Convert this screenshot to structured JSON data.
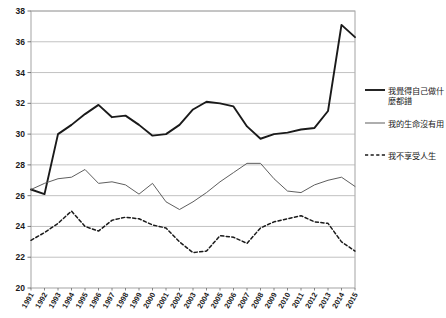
{
  "chart_data": {
    "type": "line",
    "title": "",
    "xlabel": "",
    "ylabel": "",
    "ylim": [
      20,
      38
    ],
    "ytick_step": 2,
    "grid": true,
    "legend_position": "right",
    "categories": [
      "1991",
      "1992",
      "1993",
      "1994",
      "1995",
      "1996",
      "1997",
      "1998",
      "1999",
      "2000",
      "2001",
      "2002",
      "2003",
      "2004",
      "2005",
      "2006",
      "2007",
      "2008",
      "2009",
      "2010",
      "2011",
      "2012",
      "2013",
      "2014",
      "2015"
    ],
    "yticks": [
      "20",
      "22",
      "24",
      "26",
      "28",
      "30",
      "32",
      "34",
      "36",
      "38"
    ],
    "series": [
      {
        "name": "我覺得自己做什麼都錯",
        "style": "solid-thick",
        "color": "#1a1a1a",
        "values": [
          26.4,
          26.1,
          30.0,
          30.6,
          31.3,
          31.9,
          31.1,
          31.2,
          30.6,
          29.9,
          30.0,
          30.6,
          31.6,
          32.1,
          32.0,
          31.8,
          30.5,
          29.7,
          30.0,
          30.1,
          30.3,
          30.4,
          31.5,
          37.1,
          36.3
        ]
      },
      {
        "name": "我的生命沒有用",
        "style": "solid-thin",
        "color": "#555555",
        "values": [
          26.4,
          26.8,
          27.1,
          27.2,
          27.7,
          26.8,
          26.9,
          26.7,
          26.1,
          26.8,
          25.6,
          25.1,
          25.6,
          26.2,
          26.9,
          27.5,
          28.1,
          28.1,
          27.1,
          26.3,
          26.2,
          26.7,
          27.0,
          27.2,
          26.6
        ]
      },
      {
        "name": "我不享受人生",
        "style": "dashed",
        "color": "#1a1a1a",
        "values": [
          23.1,
          23.6,
          24.2,
          25.0,
          24.0,
          23.7,
          24.4,
          24.6,
          24.5,
          24.1,
          23.9,
          23.0,
          22.3,
          22.4,
          23.4,
          23.3,
          22.9,
          23.9,
          24.3,
          24.5,
          24.7,
          24.3,
          24.2,
          23.0,
          22.4
        ]
      }
    ],
    "series_alt_readings": {
      "note": "values estimated from gridlines"
    }
  },
  "legend": {
    "items": [
      {
        "label": "我覺得自己做什麼都錯",
        "marker": "solid-thick"
      },
      {
        "label": "我的生命沒有用",
        "marker": "solid-thin"
      },
      {
        "label": "我不享受人生",
        "marker": "dashed"
      }
    ]
  }
}
